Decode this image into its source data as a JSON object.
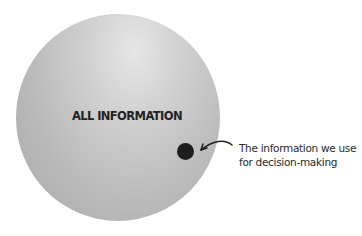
{
  "diagram": {
    "outer_circle": {
      "label": "ALL INFORMATION",
      "color": "#bdbdbd"
    },
    "inner_dot": {
      "color": "#1e1e1e"
    },
    "annotation": {
      "line1": "The information we use",
      "line2": "for decision-making"
    }
  }
}
